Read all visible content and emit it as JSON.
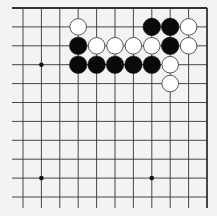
{
  "board": {
    "description": "Top-right corner of a 19x19 Go board (11x11 section)",
    "columns": 11,
    "rows": 11,
    "col_x": [
      23,
      41.4,
      59.8,
      78.2,
      96.6,
      115,
      133.4,
      151.8,
      170.2,
      188.6,
      207
    ],
    "row_y": [
      8,
      26.9,
      45.8,
      64.7,
      83.6,
      102.5,
      121.4,
      140.3,
      159.2,
      178.1,
      197
    ],
    "left_extent": 12,
    "bottom_extent": 208,
    "edges": [
      "top",
      "right"
    ],
    "colors": {
      "background": "#f3f3f3",
      "line": "#333333",
      "black_stone": "#0a0a0a",
      "white_stone": "#ffffff",
      "white_outline": "#444444"
    },
    "star_points": [
      {
        "col": 1,
        "row": 3
      },
      {
        "col": 1,
        "row": 9
      },
      {
        "col": 7,
        "row": 9
      }
    ],
    "stones": [
      {
        "color": "white",
        "col": 3,
        "row": 1
      },
      {
        "color": "black",
        "col": 7,
        "row": 1
      },
      {
        "color": "black",
        "col": 8,
        "row": 1
      },
      {
        "color": "white",
        "col": 9,
        "row": 1
      },
      {
        "color": "black",
        "col": 3,
        "row": 2
      },
      {
        "color": "white",
        "col": 4,
        "row": 2
      },
      {
        "color": "white",
        "col": 5,
        "row": 2
      },
      {
        "color": "white",
        "col": 6,
        "row": 2
      },
      {
        "color": "white",
        "col": 7,
        "row": 2
      },
      {
        "color": "black",
        "col": 8,
        "row": 2
      },
      {
        "color": "white",
        "col": 9,
        "row": 2
      },
      {
        "color": "black",
        "col": 3,
        "row": 3
      },
      {
        "color": "black",
        "col": 4,
        "row": 3
      },
      {
        "color": "black",
        "col": 5,
        "row": 3
      },
      {
        "color": "black",
        "col": 6,
        "row": 3
      },
      {
        "color": "black",
        "col": 7,
        "row": 3
      },
      {
        "color": "white",
        "col": 8,
        "row": 3
      },
      {
        "color": "white",
        "col": 8,
        "row": 4
      }
    ]
  }
}
